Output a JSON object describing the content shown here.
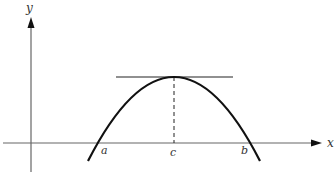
{
  "diagram": {
    "axes": {
      "x_label": "x",
      "y_label": "y"
    },
    "points": {
      "a": "a",
      "b": "b",
      "c": "c"
    },
    "colors": {
      "curve": "#111111",
      "axis": "#555555",
      "tangent": "#222222"
    }
  }
}
